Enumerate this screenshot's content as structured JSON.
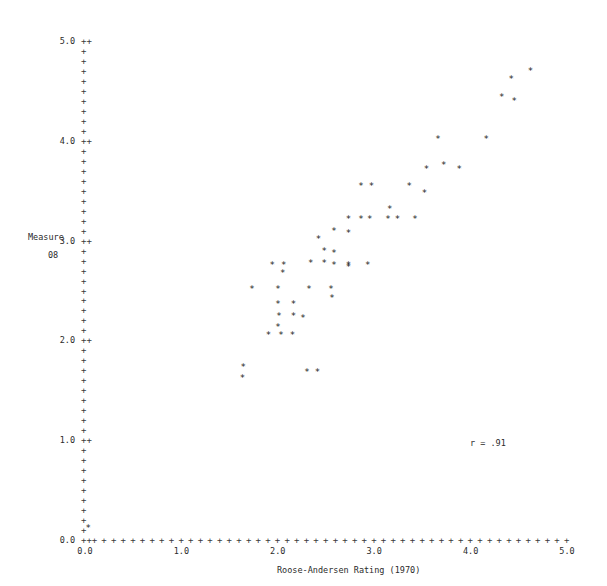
{
  "chart_data": {
    "type": "scatter",
    "title": "",
    "xlabel": "Roose-Andersen Rating (1970)",
    "ylabel_line1": "Measure",
    "ylabel_line2": "08",
    "xlim": [
      0.0,
      5.0
    ],
    "ylim": [
      0.0,
      5.0
    ],
    "grid": false,
    "legend": null,
    "annotations": [
      {
        "text": "r = .91",
        "x": 4.05,
        "y": 0.98
      }
    ],
    "xticks": [
      0.0,
      1.0,
      2.0,
      3.0,
      4.0,
      5.0
    ],
    "xtick_labels": [
      "0.0",
      "1.0",
      "2.0",
      "3.0",
      "4.0",
      "5.0"
    ],
    "yticks": [
      0.0,
      1.0,
      2.0,
      3.0,
      4.0,
      5.0
    ],
    "ytick_labels": [
      "0.0",
      "1.0",
      "2.0",
      "3.0",
      "4.0",
      "5.0"
    ],
    "tick_glyph": "+",
    "labeled_tick_glyph": "++",
    "minor_tick_step": 0.1,
    "point_marker": "*",
    "points": [
      {
        "x": 0.03,
        "y": 0.12
      },
      {
        "x": 1.64,
        "y": 1.73
      },
      {
        "x": 1.63,
        "y": 1.62
      },
      {
        "x": 1.9,
        "y": 2.05
      },
      {
        "x": 2.03,
        "y": 2.05
      },
      {
        "x": 2.15,
        "y": 2.05
      },
      {
        "x": 2.3,
        "y": 1.68
      },
      {
        "x": 2.41,
        "y": 1.68
      },
      {
        "x": 1.73,
        "y": 2.52
      },
      {
        "x": 2.0,
        "y": 2.52
      },
      {
        "x": 2.0,
        "y": 2.36
      },
      {
        "x": 2.01,
        "y": 2.24
      },
      {
        "x": 2.0,
        "y": 2.13
      },
      {
        "x": 2.16,
        "y": 2.36
      },
      {
        "x": 2.16,
        "y": 2.24
      },
      {
        "x": 2.26,
        "y": 2.22
      },
      {
        "x": 2.32,
        "y": 2.52
      },
      {
        "x": 2.55,
        "y": 2.52
      },
      {
        "x": 2.56,
        "y": 2.42
      },
      {
        "x": 2.73,
        "y": 2.74
      },
      {
        "x": 1.94,
        "y": 2.76
      },
      {
        "x": 2.06,
        "y": 2.76
      },
      {
        "x": 2.05,
        "y": 2.68
      },
      {
        "x": 2.34,
        "y": 2.78
      },
      {
        "x": 2.48,
        "y": 2.78
      },
      {
        "x": 2.48,
        "y": 2.9
      },
      {
        "x": 2.58,
        "y": 2.88
      },
      {
        "x": 2.42,
        "y": 3.02
      },
      {
        "x": 2.58,
        "y": 2.76
      },
      {
        "x": 2.73,
        "y": 2.76
      },
      {
        "x": 2.93,
        "y": 2.76
      },
      {
        "x": 2.58,
        "y": 3.1
      },
      {
        "x": 2.73,
        "y": 3.22
      },
      {
        "x": 2.73,
        "y": 3.08
      },
      {
        "x": 2.86,
        "y": 3.22
      },
      {
        "x": 2.95,
        "y": 3.22
      },
      {
        "x": 3.14,
        "y": 3.22
      },
      {
        "x": 3.24,
        "y": 3.22
      },
      {
        "x": 3.42,
        "y": 3.22
      },
      {
        "x": 3.16,
        "y": 3.32
      },
      {
        "x": 2.86,
        "y": 3.55
      },
      {
        "x": 2.97,
        "y": 3.55
      },
      {
        "x": 3.36,
        "y": 3.55
      },
      {
        "x": 3.52,
        "y": 3.48
      },
      {
        "x": 3.54,
        "y": 3.72
      },
      {
        "x": 3.72,
        "y": 3.76
      },
      {
        "x": 3.88,
        "y": 3.72
      },
      {
        "x": 3.66,
        "y": 4.02
      },
      {
        "x": 4.16,
        "y": 4.02
      },
      {
        "x": 4.32,
        "y": 4.44
      },
      {
        "x": 4.45,
        "y": 4.4
      },
      {
        "x": 4.42,
        "y": 4.62
      },
      {
        "x": 4.62,
        "y": 4.7
      }
    ]
  }
}
